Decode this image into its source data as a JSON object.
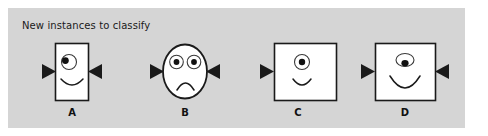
{
  "figure": {
    "caption": "New instances to classify",
    "background_color": "#ffffff",
    "panel_color": "#d5d5d5",
    "stroke_color": "#1a1a1a",
    "face_fill": "#ffffff"
  },
  "instances": [
    {
      "label": "A",
      "head_shape": "square",
      "eyes": 1,
      "eye_style": "circle-outline-pupil-upper-left",
      "mouth": "smile",
      "ears": [
        "left",
        "right"
      ],
      "name": "instance-a"
    },
    {
      "label": "B",
      "head_shape": "ellipse",
      "eyes": 2,
      "eye_style": "circle-outline-pupil-center",
      "mouth": "frown",
      "ears": [
        "left",
        "right"
      ],
      "name": "instance-b"
    },
    {
      "label": "C",
      "head_shape": "square",
      "eyes": 1,
      "eye_style": "circle-outline-pupil-center",
      "mouth": "smile",
      "ears": [
        "left"
      ],
      "name": "instance-c"
    },
    {
      "label": "D",
      "head_shape": "square",
      "eyes": 1,
      "eye_style": "ellipse-outline-pupil-bottom",
      "mouth": "deep-smile",
      "ears": [
        "left",
        "right"
      ],
      "name": "instance-d"
    }
  ]
}
